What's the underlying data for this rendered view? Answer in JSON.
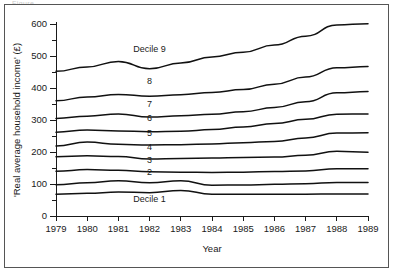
{
  "caption": {
    "clipped_text": "Figure"
  },
  "chart_data": {
    "type": "line",
    "title": "",
    "xlabel": "Year",
    "ylabel": "'Real average household income' (£)",
    "x": [
      1979,
      1980,
      1981,
      1982,
      1983,
      1984,
      1985,
      1986,
      1987,
      1988,
      1989
    ],
    "xtick_labels": [
      "1979",
      "1980",
      "1981",
      "1982",
      "1983",
      "1984",
      "1985",
      "1986",
      "1987",
      "1988",
      "1989"
    ],
    "ytick_labels": [
      "0",
      "100",
      "200",
      "300",
      "400",
      "500",
      "600"
    ],
    "ytick_values": [
      0,
      100,
      200,
      300,
      400,
      500,
      600
    ],
    "yminor_values": [
      50,
      150,
      250,
      350,
      450,
      550
    ],
    "ylim": [
      0,
      620
    ],
    "xlim": [
      1979,
      1989
    ],
    "grid": false,
    "legend": "inline-labels",
    "line_color": "#111111",
    "series": [
      {
        "name": "Decile 9",
        "label": "Decile 9",
        "values": [
          452,
          466,
          483,
          460,
          478,
          497,
          512,
          534,
          562,
          597,
          601
        ]
      },
      {
        "name": "Decile 8",
        "label": "8",
        "values": [
          360,
          372,
          380,
          374,
          379,
          386,
          395,
          412,
          434,
          463,
          467
        ]
      },
      {
        "name": "Decile 7",
        "label": "7",
        "values": [
          305,
          312,
          319,
          309,
          313,
          318,
          326,
          339,
          357,
          385,
          389
        ]
      },
      {
        "name": "Decile 6",
        "label": "6",
        "values": [
          262,
          269,
          266,
          263,
          265,
          270,
          278,
          289,
          302,
          318,
          319
        ]
      },
      {
        "name": "Decile 5",
        "label": "5",
        "values": [
          219,
          231,
          224,
          222,
          223,
          225,
          229,
          233,
          244,
          259,
          260
        ]
      },
      {
        "name": "Decile 4",
        "label": "4",
        "values": [
          185,
          188,
          186,
          178,
          180,
          181,
          183,
          184,
          190,
          202,
          199
        ]
      },
      {
        "name": "Decile 3",
        "label": "3",
        "values": [
          140,
          145,
          143,
          138,
          137,
          136,
          137,
          139,
          141,
          148,
          148
        ]
      },
      {
        "name": "Decile 2",
        "label": "2",
        "values": [
          98,
          104,
          110,
          104,
          110,
          96,
          97,
          99,
          101,
          105,
          105
        ]
      },
      {
        "name": "Decile 1",
        "label": "Decile 1",
        "values": [
          68,
          71,
          75,
          73,
          80,
          68,
          68,
          68,
          68,
          69,
          69
        ]
      }
    ],
    "inline_label_positions": [
      {
        "series": "Decile 9",
        "x": 1982.0,
        "y": 512
      },
      {
        "series": "Decile 8",
        "x": 1982.0,
        "y": 411
      },
      {
        "series": "Decile 7",
        "x": 1982.0,
        "y": 342
      },
      {
        "series": "Decile 6",
        "x": 1982.0,
        "y": 296
      },
      {
        "series": "Decile 5",
        "x": 1982.0,
        "y": 250
      },
      {
        "series": "Decile 4",
        "x": 1982.0,
        "y": 207
      },
      {
        "series": "Decile 3",
        "x": 1982.0,
        "y": 165
      },
      {
        "series": "Decile 2",
        "x": 1982.0,
        "y": 127
      },
      {
        "series": "Decile 1",
        "x": 1982.0,
        "y": 44
      }
    ]
  }
}
